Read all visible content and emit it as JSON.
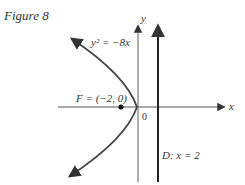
{
  "figure": {
    "caption": "Figure 8",
    "equation_label": "y² = −8x",
    "focus_label": "F = (−2, 0)",
    "origin_label": "0",
    "directrix_label": "D: x = 2",
    "x_axis_label": "x",
    "y_axis_label": "y"
  },
  "colors": {
    "curve": "#444444",
    "axis": "#555555",
    "directrix": "#222222",
    "text": "#333333"
  },
  "geometry": {
    "parabola": "y^2 = -8x",
    "focus": [
      -2,
      0
    ],
    "directrix_x": 2,
    "vertex": [
      0,
      0
    ]
  }
}
